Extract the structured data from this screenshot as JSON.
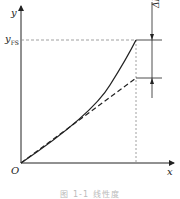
{
  "diagram": {
    "axes": {
      "x_label": "x",
      "y_label": "y",
      "origin_label": "O"
    },
    "y_fs_label": "y",
    "y_fs_subscript": "FS",
    "delta_label": "ΔL",
    "delta_subscript": "max",
    "curves": [
      {
        "name": "actual-characteristic-curve",
        "style": "solid"
      },
      {
        "name": "fitted-straight-line",
        "style": "dashed"
      }
    ],
    "colors": {
      "line": "#222222",
      "guide": "#888888"
    }
  },
  "caption": "图 1-1 线性度"
}
